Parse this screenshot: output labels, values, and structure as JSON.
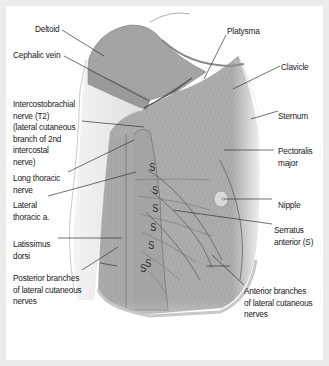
{
  "figure": {
    "colors": {
      "background": "#ececec",
      "panel": "#ffffff",
      "muscle": "#ababab",
      "muscle_dark": "#8e8e8e",
      "skin": "#e4e4e4",
      "leader_line": "#333333",
      "text": "#1a1a1a"
    },
    "labels": [
      {
        "id": "deltoid",
        "text": "Deltoid"
      },
      {
        "id": "cephalic-vein",
        "text": "Cephalic vein"
      },
      {
        "id": "intercostobrachial-nerve",
        "text": "Intercostobrachial\nnerve (T2)\n(lateral cutaneous\nbranch of 2nd\nintercostal\nnerve)"
      },
      {
        "id": "long-thoracic-nerve",
        "text": "Long thoracic\nnerve"
      },
      {
        "id": "lateral-thoracic-artery",
        "text": "Lateral\nthoracic a."
      },
      {
        "id": "latissimus-dorsi",
        "text": "Latissimus\ndorsi"
      },
      {
        "id": "posterior-branches",
        "text": "Posterior branches\nof lateral cutaneous\nnerves"
      },
      {
        "id": "platysma",
        "text": "Platysma"
      },
      {
        "id": "clavicle",
        "text": "Clavicle"
      },
      {
        "id": "sternum",
        "text": "Sternum"
      },
      {
        "id": "pectoralis-major",
        "text": "Pectoralis\nmajor"
      },
      {
        "id": "nipple",
        "text": "Nipple"
      },
      {
        "id": "serratus-anterior",
        "text": "Serratus\nanterior (S)"
      },
      {
        "id": "anterior-branches",
        "text": "Anterior branches\nof lateral cutaneous\nnerves"
      }
    ],
    "serratus_marker": "S",
    "serratus_marker_count": 7
  }
}
